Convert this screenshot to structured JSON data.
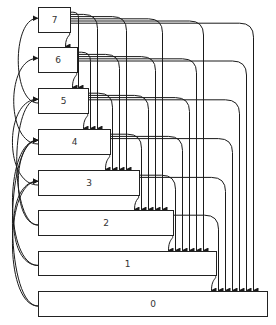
{
  "diagram": {
    "title": "",
    "nodes": [
      {
        "id": "7",
        "label": "7",
        "x": 38,
        "y": 7,
        "w": 32,
        "h": 25
      },
      {
        "id": "6",
        "label": "6",
        "x": 38,
        "y": 47,
        "w": 39,
        "h": 25
      },
      {
        "id": "5",
        "label": "5",
        "x": 38,
        "y": 88,
        "w": 50,
        "h": 25
      },
      {
        "id": "4",
        "label": "4",
        "x": 38,
        "y": 129,
        "w": 72,
        "h": 25
      },
      {
        "id": "3",
        "label": "3",
        "x": 38,
        "y": 170,
        "w": 101,
        "h": 25
      },
      {
        "id": "2",
        "label": "2",
        "x": 38,
        "y": 210,
        "w": 135,
        "h": 25
      },
      {
        "id": "1",
        "label": "1",
        "x": 38,
        "y": 251,
        "w": 178,
        "h": 24
      },
      {
        "id": "0",
        "label": "0",
        "x": 38,
        "y": 291,
        "w": 229,
        "h": 25
      }
    ],
    "edges_description": "Each node i has a downward arrow to every node j < i along the right side, and curved arcs on the left side from lower nodes back up to nodes two levels above.",
    "colors": {
      "stroke": "#1a1a1a",
      "box_fill": "#ffffff",
      "text": "#333333"
    }
  }
}
